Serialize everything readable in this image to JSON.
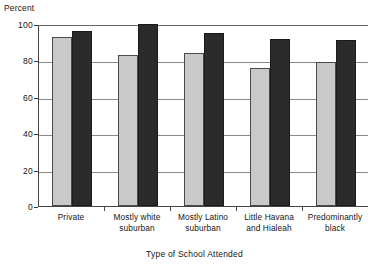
{
  "chart_data": {
    "type": "bar",
    "title": "",
    "xlabel": "Type of School Attended",
    "ylabel": "Percent",
    "ylim": [
      0,
      100
    ],
    "yticks": [
      0,
      20,
      40,
      60,
      80,
      100
    ],
    "ytick_labels": [
      "0",
      "20",
      "40",
      "60",
      "80",
      "100"
    ],
    "grid": true,
    "legend": "none",
    "categories": [
      "Private",
      "Mostly white suburban",
      "Mostly Latino suburban",
      "Little Havana and Hialeah",
      "Predominantly black"
    ],
    "category_lines": [
      [
        "Private"
      ],
      [
        "Mostly white",
        "suburban"
      ],
      [
        "Mostly Latino",
        "suburban"
      ],
      [
        "Little Havana",
        "and Hialeah"
      ],
      [
        "Predominantly",
        "black"
      ]
    ],
    "series": [
      {
        "name": "light-series",
        "color": "#c9c9c9",
        "values": [
          93,
          83,
          84,
          76,
          79
        ]
      },
      {
        "name": "dark-series",
        "color": "#2b2b2b",
        "values": [
          96,
          100,
          95,
          92,
          91
        ]
      }
    ]
  },
  "colors": {
    "light_bar": "#c9c9c9",
    "dark_bar": "#2b2b2b",
    "bar_outline": "#4a4a4a",
    "gridline": "#8a8a8a",
    "axis": "#444444",
    "text": "#151515",
    "background": "#ffffff"
  }
}
